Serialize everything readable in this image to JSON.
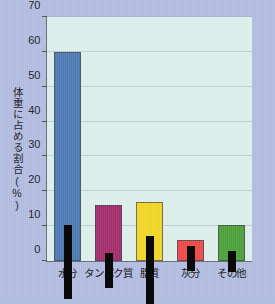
{
  "chart_data": {
    "type": "bar",
    "title": "",
    "xlabel": "",
    "ylabel": "体重に占める割合(%)",
    "ylim": [
      0,
      70
    ],
    "yticks": [
      0,
      10,
      20,
      30,
      40,
      50,
      60,
      70
    ],
    "ytick_labels": [
      "0",
      "10",
      "20",
      "30",
      "40",
      "50",
      "60",
      "70"
    ],
    "grid": true,
    "legend": "none",
    "categories": [
      "水分",
      "タンパク質",
      "脂質",
      "灰分",
      "その他"
    ],
    "values": [
      60,
      16,
      17,
      6,
      10.3
    ],
    "error_low": [
      49,
      8,
      4.5,
      3,
      7
    ],
    "error_high": [
      70,
      18,
      24,
      10,
      13
    ],
    "colors": [
      "#4f7cb5",
      "#a5306f",
      "#f2d729",
      "#ef4b4b",
      "#4ea33c"
    ],
    "bars": [
      {
        "label": "水分",
        "value": 60,
        "low": 49,
        "high": 70,
        "color": "#4f7cb5"
      },
      {
        "label": "タンパク質",
        "value": 16,
        "low": 8,
        "high": 18,
        "color": "#a5306f"
      },
      {
        "label": "脂質",
        "value": 17,
        "low": 4.5,
        "high": 24,
        "color": "#f2d729"
      },
      {
        "label": "灰分",
        "value": 6,
        "low": 3,
        "high": 10,
        "color": "#ef4b4b"
      },
      {
        "label": "その他",
        "value": 10.3,
        "low": 7,
        "high": 13,
        "color": "#4ea33c"
      }
    ]
  }
}
